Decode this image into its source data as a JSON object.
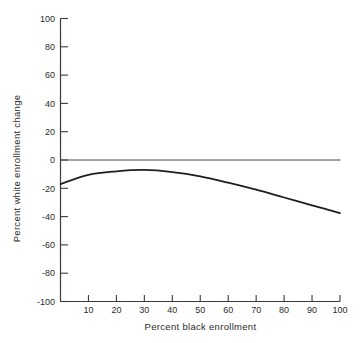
{
  "chart_data": {
    "type": "line",
    "title": "",
    "xlabel": "Percent black enrollment",
    "ylabel": "Percent white enrollment change",
    "xlim": [
      0,
      100
    ],
    "ylim": [
      -100,
      100
    ],
    "x_ticks": [
      10,
      20,
      30,
      40,
      50,
      60,
      70,
      80,
      90,
      100
    ],
    "y_ticks": [
      100,
      80,
      60,
      40,
      20,
      0,
      -20,
      -40,
      -60,
      -80,
      -100
    ],
    "grid": false,
    "legend_position": "none",
    "series": [
      {
        "name": "zero-reference-line",
        "smooth": false,
        "x": [
          0,
          100
        ],
        "y": [
          0,
          0
        ],
        "color": "#4a4a4a",
        "stroke_width": 1
      },
      {
        "name": "white-enrollment-change-curve",
        "smooth": true,
        "x": [
          0,
          10,
          20,
          30,
          40,
          50,
          60,
          70,
          80,
          90,
          100
        ],
        "y": [
          -17,
          -10.5,
          -8,
          -7,
          -8.5,
          -11.5,
          -16,
          -21,
          -26.5,
          -32,
          -37.5
        ],
        "color": "#1f1f1f",
        "stroke_width": 1.8
      }
    ],
    "colors": {
      "axis": "#3a3a3a",
      "text": "#2b2b2b",
      "background": "#ffffff"
    }
  }
}
